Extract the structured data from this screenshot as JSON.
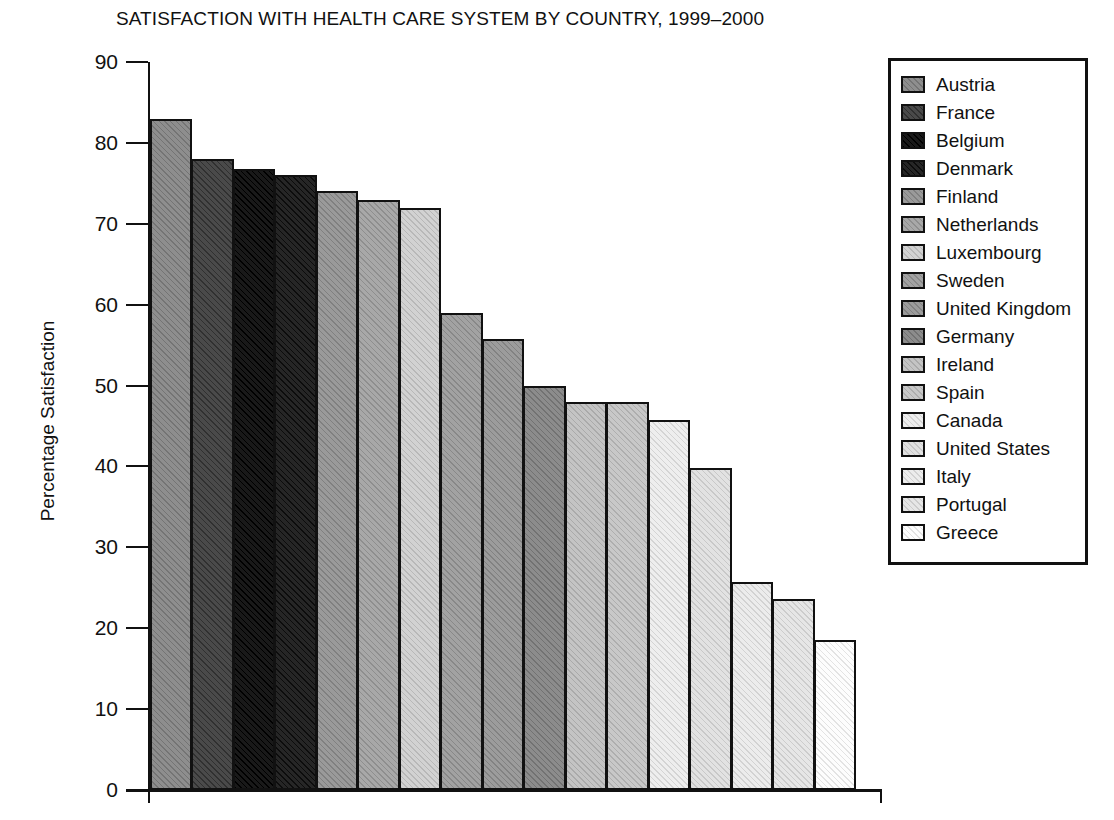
{
  "chart_data": {
    "type": "bar",
    "title": "SATISFACTION WITH HEALTH CARE SYSTEM BY COUNTRY, 1999–2000",
    "xlabel": "",
    "ylabel": "Percentage Satisfaction",
    "ylim": [
      0,
      90
    ],
    "yticks": [
      90,
      80,
      70,
      60,
      50,
      40,
      30,
      20,
      10,
      0
    ],
    "grid": false,
    "legend_position": "right",
    "categories": [
      "Austria",
      "France",
      "Belgium",
      "Denmark",
      "Finland",
      "Netherlands",
      "Luxembourg",
      "Sweden",
      "United Kingdom",
      "Germany",
      "Ireland",
      "Spain",
      "Canada",
      "United States",
      "Italy",
      "Portugal",
      "Greece"
    ],
    "values": [
      83.0,
      78.0,
      76.8,
      76.0,
      74.0,
      73.0,
      72.0,
      59.0,
      55.7,
      49.9,
      48.0,
      48.0,
      45.8,
      39.8,
      25.7,
      23.6,
      18.6
    ],
    "colors": [
      "#8e8e8e",
      "#4a4a4a",
      "#191919",
      "#262626",
      "#9a9a9a",
      "#a8a8a8",
      "#d2d2d2",
      "#a2a2a2",
      "#9c9c9c",
      "#8c8c8c",
      "#c4c4c4",
      "#c8c8c8",
      "#eeeeee",
      "#e2e2e2",
      "#ececec",
      "#e6e6e6",
      "#fdfdfd"
    ]
  },
  "legend": {
    "items": [
      {
        "label": "Austria",
        "color": "#8e8e8e"
      },
      {
        "label": "France",
        "color": "#4a4a4a"
      },
      {
        "label": "Belgium",
        "color": "#191919"
      },
      {
        "label": "Denmark",
        "color": "#262626"
      },
      {
        "label": "Finland",
        "color": "#9a9a9a"
      },
      {
        "label": "Netherlands",
        "color": "#a8a8a8"
      },
      {
        "label": "Luxembourg",
        "color": "#d2d2d2"
      },
      {
        "label": "Sweden",
        "color": "#a2a2a2"
      },
      {
        "label": "United Kingdom",
        "color": "#9c9c9c"
      },
      {
        "label": "Germany",
        "color": "#8c8c8c"
      },
      {
        "label": "Ireland",
        "color": "#c4c4c4"
      },
      {
        "label": "Spain",
        "color": "#c8c8c8"
      },
      {
        "label": "Canada",
        "color": "#eeeeee"
      },
      {
        "label": "United States",
        "color": "#e2e2e2"
      },
      {
        "label": "Italy",
        "color": "#ececec"
      },
      {
        "label": "Portugal",
        "color": "#e6e6e6"
      },
      {
        "label": "Greece",
        "color": "#fdfdfd"
      }
    ]
  },
  "axis": {
    "y_title": "Percentage Satisfaction",
    "y_tick_labels": [
      "90",
      "80",
      "70",
      "60",
      "50",
      "40",
      "30",
      "20",
      "10",
      "0"
    ]
  },
  "bottom_caption": ""
}
